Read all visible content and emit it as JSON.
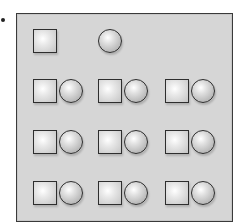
{
  "figure": {
    "bullet": "•",
    "colors": {
      "panel": "#d6d6d6",
      "border": "#3a3a3a",
      "shape_outline": "#2e2e2e"
    },
    "rows": [
      {
        "items": [
          {
            "col": 0,
            "shapes": [
              "square"
            ]
          },
          {
            "col": 1,
            "shapes": [
              "circle"
            ]
          }
        ]
      },
      {
        "items": [
          {
            "col": 0,
            "shapes": [
              "square",
              "circle"
            ]
          },
          {
            "col": 1,
            "shapes": [
              "square",
              "circle"
            ]
          },
          {
            "col": 2,
            "shapes": [
              "square",
              "circle"
            ]
          }
        ]
      },
      {
        "items": [
          {
            "col": 0,
            "shapes": [
              "square",
              "circle"
            ]
          },
          {
            "col": 1,
            "shapes": [
              "square",
              "circle"
            ]
          },
          {
            "col": 2,
            "shapes": [
              "square",
              "circle"
            ]
          }
        ]
      },
      {
        "items": [
          {
            "col": 0,
            "shapes": [
              "square",
              "circle"
            ]
          },
          {
            "col": 1,
            "shapes": [
              "square",
              "circle"
            ]
          },
          {
            "col": 2,
            "shapes": [
              "square",
              "circle"
            ]
          }
        ]
      }
    ]
  }
}
